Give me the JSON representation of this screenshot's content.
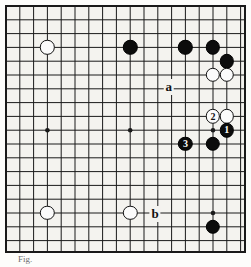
{
  "figure": {
    "kind": "go-board-diagram",
    "caption": "Fig."
  },
  "board": {
    "columns": 18,
    "rows": 18,
    "cell_size": 13.8,
    "origin_x": 6,
    "origin_y": 6,
    "line_color": "#1a1a1a",
    "board_color": "#f4f3ef",
    "border_color": "#1a1a1a",
    "star_points": [
      {
        "col": 3,
        "row": 9
      },
      {
        "col": 9,
        "row": 9
      },
      {
        "col": 15,
        "row": 9
      },
      {
        "col": 15,
        "row": 15
      }
    ]
  },
  "stones": [
    {
      "id": "w-upper-left",
      "color": "white",
      "col": 3,
      "row": 3,
      "label": ""
    },
    {
      "id": "b-top-c9",
      "color": "black",
      "col": 9,
      "row": 3,
      "label": ""
    },
    {
      "id": "b-top-c13",
      "color": "black",
      "col": 13,
      "row": 3,
      "label": ""
    },
    {
      "id": "b-top-c15",
      "color": "black",
      "col": 15,
      "row": 3,
      "label": ""
    },
    {
      "id": "b-top-c16",
      "color": "black",
      "col": 16,
      "row": 4,
      "label": ""
    },
    {
      "id": "w-right-c15",
      "color": "white",
      "col": 15,
      "row": 5,
      "label": ""
    },
    {
      "id": "w-right-c16",
      "color": "white",
      "col": 16,
      "row": 5,
      "label": ""
    },
    {
      "id": "w-move-2",
      "color": "white",
      "col": 15,
      "row": 8,
      "label": "2"
    },
    {
      "id": "w-right-c16-r8",
      "color": "white",
      "col": 16,
      "row": 8,
      "label": ""
    },
    {
      "id": "b-move-1",
      "color": "black",
      "col": 16,
      "row": 9,
      "label": "1"
    },
    {
      "id": "b-move-3",
      "color": "black",
      "col": 13,
      "row": 10,
      "label": "3"
    },
    {
      "id": "b-center-c15",
      "color": "black",
      "col": 15,
      "row": 10,
      "label": ""
    },
    {
      "id": "w-lower-left",
      "color": "white",
      "col": 3,
      "row": 15,
      "label": ""
    },
    {
      "id": "w-lower-c9",
      "color": "white",
      "col": 9,
      "row": 15,
      "label": ""
    },
    {
      "id": "b-lower-c15",
      "color": "black",
      "col": 15,
      "row": 16,
      "label": ""
    }
  ],
  "letters": [
    {
      "id": "letter-a",
      "text": "a",
      "col": 11.8,
      "row": 5.9
    },
    {
      "id": "letter-b",
      "text": "b",
      "col": 10.8,
      "row": 15.1
    }
  ],
  "colors": {
    "black_stone": "#0c0c0c",
    "white_stone": "#fbfbfb",
    "stone_outline": "#111111",
    "grid_line": "#1a1a1a",
    "paper": "#f4f3ef"
  }
}
